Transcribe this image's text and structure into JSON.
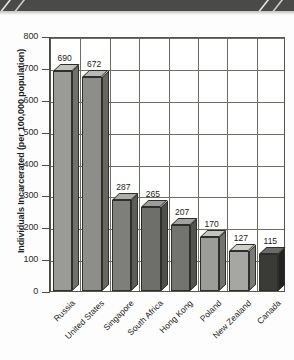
{
  "decor": {
    "top_band_color": "#4a4a48",
    "chevron_color": "#e8e8e4"
  },
  "chart_data": {
    "type": "bar",
    "title": "",
    "subtitle": "",
    "xlabel": "",
    "ylabel": "Individuals Incarcerated (per 100,000 population)",
    "ylim": [
      0,
      800
    ],
    "ytick_labels": [
      "0",
      "100",
      "200",
      "300",
      "400",
      "500",
      "600",
      "700",
      "800"
    ],
    "ytick_values": [
      0,
      100,
      200,
      300,
      400,
      500,
      600,
      700,
      800
    ],
    "grid": "both",
    "legend": "none",
    "categories": [
      "Russia",
      "United States",
      "Singapore",
      "South Africa",
      "Hong Kong",
      "Poland",
      "New Zealand",
      "Canada"
    ],
    "values": [
      690,
      672,
      287,
      265,
      207,
      170,
      127,
      115
    ],
    "value_labels": [
      "690",
      "672",
      "287",
      "265",
      "207",
      "170",
      "127",
      "115"
    ],
    "bar_colors": [
      "#9a9a97",
      "#8d8d8a",
      "#7e7e7b",
      "#6e6e6b",
      "#73736f",
      "#9c9c98",
      "#a6a6a2",
      "#3a3a37"
    ],
    "bar_top_colors": [
      "#c2c2bf",
      "#b8b8b4",
      "#acaca8",
      "#9d9d99",
      "#a2a29e",
      "#c4c4c0",
      "#cdcdc9",
      "#6a6a66"
    ],
    "bar_side_colors": [
      "#6f6f6c",
      "#67675f",
      "#5c5c58",
      "#4f4f4b",
      "#53534f",
      "#727270",
      "#7a7a77",
      "#222220"
    ]
  }
}
